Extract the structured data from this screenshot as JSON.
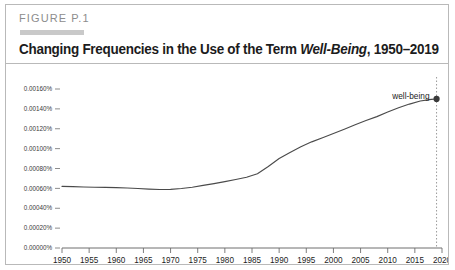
{
  "figure": {
    "label": "FIGURE P.1",
    "title_prefix": "Changing Frequencies in the Use of the Term ",
    "title_term": "Well-Being",
    "title_suffix": ", 1950–2019"
  },
  "chart_data": {
    "type": "line",
    "title": "Changing Frequencies in the Use of the Term Well-Being, 1950–2019",
    "xlabel": "",
    "ylabel": "",
    "xlim": [
      1950,
      2020
    ],
    "ylim": [
      0.0,
      0.0016
    ],
    "grid": false,
    "legend_position": "inline-right",
    "xticks": [
      1950,
      1955,
      1960,
      1965,
      1970,
      1975,
      1980,
      1985,
      1990,
      1995,
      2000,
      2005,
      2010,
      2015,
      2020
    ],
    "xtick_labels": [
      "1950",
      "1955",
      "1960",
      "1965",
      "1970",
      "1975",
      "1980",
      "1985",
      "1990",
      "1995",
      "2000",
      "2005",
      "2010",
      "2015",
      "2020"
    ],
    "yticks": [
      0.0,
      0.0002,
      0.0004,
      0.0006,
      0.0008,
      0.001,
      0.0012,
      0.0014,
      0.0016
    ],
    "ytick_labels": [
      "0.00000%",
      "0.00020%",
      "0.00040%",
      "0.00060%",
      "0.00080%",
      "0.00100%",
      "0.00120%",
      "0.00140%",
      "0.00160%"
    ],
    "series": [
      {
        "name": "well-being",
        "color": "#4a4a4a",
        "annotation": "well-being",
        "endpoint_marker": true,
        "endpoint_year": 2019,
        "endpoint_value": 0.0015,
        "x": [
          1950,
          1952,
          1954,
          1956,
          1958,
          1960,
          1962,
          1964,
          1966,
          1968,
          1970,
          1972,
          1974,
          1976,
          1978,
          1980,
          1982,
          1984,
          1986,
          1988,
          1990,
          1992,
          1994,
          1996,
          1998,
          2000,
          2002,
          2004,
          2006,
          2008,
          2010,
          2012,
          2014,
          2016,
          2018,
          2019
        ],
        "values": [
          0.00062,
          0.000618,
          0.000614,
          0.000612,
          0.00061,
          0.000608,
          0.000604,
          0.000598,
          0.000592,
          0.000588,
          0.00059,
          0.000598,
          0.000612,
          0.00063,
          0.000648,
          0.000668,
          0.00069,
          0.000712,
          0.000748,
          0.00082,
          0.0009,
          0.000962,
          0.001018,
          0.001068,
          0.00111,
          0.001152,
          0.001196,
          0.00124,
          0.001282,
          0.001322,
          0.001368,
          0.001412,
          0.001448,
          0.00148,
          0.001496,
          0.0015
        ]
      }
    ],
    "reference_line": {
      "type": "vertical-dotted",
      "x": 2019,
      "color": "#9a9a9a"
    }
  },
  "colors": {
    "border": "#b9b9b9",
    "label_grey": "#8d8d8d",
    "swatch": "#c9c9c9",
    "line": "#4a4a4a",
    "axis": "#6f6f6f",
    "text": "#1c1c1c"
  }
}
